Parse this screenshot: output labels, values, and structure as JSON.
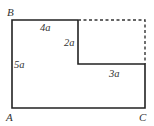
{
  "diagram": {
    "type": "geometric-figure",
    "colors": {
      "line": "#222222",
      "dashed": "#333333",
      "text": "#333333",
      "background": "#ffffff"
    },
    "vertices": {
      "A": {
        "label": "A"
      },
      "B": {
        "label": "B"
      },
      "C": {
        "label": "C"
      }
    },
    "dimensions": {
      "top": "4a",
      "step_vertical": "2a",
      "left": "5a",
      "step_horizontal": "3a"
    }
  }
}
